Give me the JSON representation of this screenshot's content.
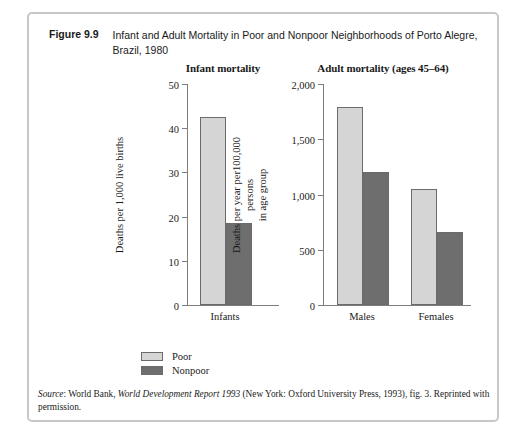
{
  "caption": {
    "number": "Figure 9.9",
    "text": "Infant and Adult Mortality in Poor and Nonpoor Neighborhoods of Porto Alegre, Brazil, 1980"
  },
  "legend": {
    "items": [
      {
        "label": "Poor",
        "color": "#d5d5d5"
      },
      {
        "label": "Nonpoor",
        "color": "#6e6e6e"
      }
    ]
  },
  "source": {
    "label": "Source",
    "part1": ": World Bank, ",
    "italic_title": "World Development Report 1993",
    "part2": " (New York: Oxford University Press, 1993), fig. 3. Reprinted with permission."
  },
  "colors": {
    "poor": "#d5d5d5",
    "nonpoor": "#6e6e6e",
    "axis": "#7d7d7d",
    "border": "#c8c8c8"
  },
  "chart_data": [
    {
      "type": "bar",
      "title": "Infant mortality",
      "xlabel": "",
      "ylabel": "Deaths per 1,000 live births",
      "categories": [
        "Infants"
      ],
      "series": [
        {
          "name": "Poor",
          "values": [
            42.5
          ],
          "color": "#d5d5d5"
        },
        {
          "name": "Nonpoor",
          "values": [
            18.5
          ],
          "color": "#6e6e6e"
        }
      ],
      "ylim": [
        0,
        50
      ],
      "yticks": [
        0,
        10,
        20,
        30,
        40,
        50
      ],
      "ytick_labels": [
        "0",
        "10",
        "20",
        "30",
        "40",
        "50"
      ],
      "grid": false,
      "legend_position": "below-left"
    },
    {
      "type": "bar",
      "title": "Adult mortality (ages 45–64)",
      "xlabel": "",
      "ylabel": "Deaths per year per100,000 persons in age group",
      "ylabel_line1": "Deaths per year per100,000 persons",
      "ylabel_line2": "in age group",
      "categories": [
        "Males",
        "Females"
      ],
      "series": [
        {
          "name": "Poor",
          "values": [
            1790,
            1050
          ],
          "color": "#d5d5d5"
        },
        {
          "name": "Nonpoor",
          "values": [
            1200,
            660
          ],
          "color": "#6e6e6e"
        }
      ],
      "ylim": [
        0,
        2000
      ],
      "yticks": [
        0,
        500,
        1000,
        1500,
        2000
      ],
      "ytick_labels": [
        "0",
        "500",
        "1,000",
        "1,500",
        "2,000"
      ],
      "grid": false,
      "legend_position": "below-left"
    }
  ]
}
